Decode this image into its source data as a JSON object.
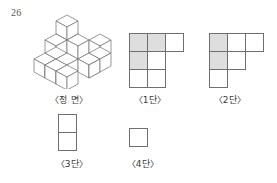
{
  "problem": {
    "number": "26"
  },
  "figures": {
    "front": {
      "caption": "〈정 면〉",
      "type": "isometric-cube-solid",
      "cube_count": 11
    },
    "level1": {
      "caption": "〈1단〉",
      "rows": [
        [
          "shaded",
          "shaded",
          "white"
        ],
        [
          "shaded",
          "white",
          null
        ],
        [
          "white",
          "white",
          null
        ]
      ]
    },
    "level2": {
      "caption": "〈2단〉",
      "rows": [
        [
          "shaded",
          "white",
          "white"
        ],
        [
          "shaded",
          "white",
          null
        ],
        [
          "white",
          null,
          null
        ]
      ]
    },
    "level3": {
      "caption": "〈3단〉",
      "rows": [
        [
          "white"
        ],
        [
          "white"
        ]
      ]
    },
    "level4": {
      "caption": "〈4단〉",
      "rows": [
        [
          "white"
        ]
      ]
    }
  },
  "colors": {
    "stroke": "#6f6f6f",
    "shade": "#dedede",
    "background": "#ffffff",
    "text": "#3a3a3a"
  }
}
